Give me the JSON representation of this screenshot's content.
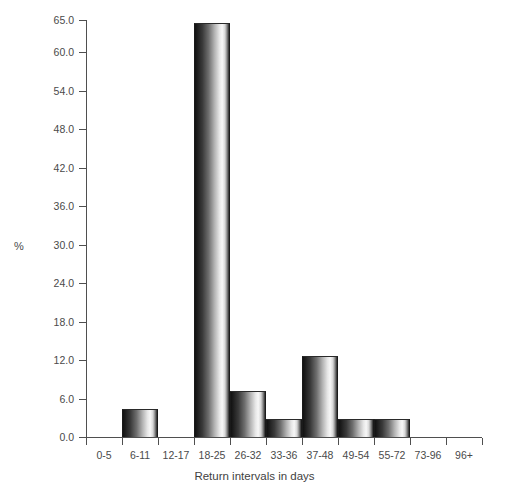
{
  "chart_data": {
    "type": "bar",
    "title": "",
    "subtitle": "",
    "xlabel": "Return intervals in days",
    "ylabel": "%",
    "categories": [
      "0-5",
      "6-11",
      "12-17",
      "18-25",
      "26-32",
      "33-36",
      "37-48",
      "49-54",
      "55-72",
      "73-96",
      "96+"
    ],
    "values": [
      0.0,
      4.4,
      0.0,
      64.6,
      7.2,
      2.8,
      12.6,
      2.8,
      2.8,
      0.0,
      0.0
    ],
    "ylim": [
      0.0,
      65.0
    ],
    "ytick_labels": [
      "0.0",
      "6.0",
      "12.0",
      "18.0",
      "24.0",
      "30.0",
      "36.0",
      "42.0",
      "48.0",
      "54.0",
      "60.0",
      "65.0"
    ],
    "ytick_values": [
      0.0,
      6.0,
      12.0,
      18.0,
      24.0,
      30.0,
      36.0,
      42.0,
      48.0,
      54.0,
      60.0,
      65.0
    ],
    "grid": false,
    "legend": null,
    "legend_position": "none",
    "bar_style": "vertical-gradient-greyscale",
    "axis_color": "#4f4f4f",
    "text_color": "#4a4a4a",
    "background_color": "#ffffff"
  },
  "axes": {
    "y_title": "%",
    "x_title": "Return intervals in days"
  }
}
